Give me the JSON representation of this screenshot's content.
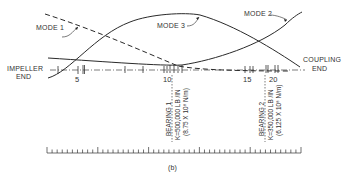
{
  "diagram": {
    "subfigure_label": "(b)",
    "modes": [
      {
        "id": "mode1",
        "label": "MODE 1",
        "style": "dashed"
      },
      {
        "id": "mode2",
        "label": "MODE 2",
        "style": "solid"
      },
      {
        "id": "mode3",
        "label": "MODE 3",
        "style": "solid"
      }
    ],
    "ends": {
      "left": {
        "line1": "IMPELLER",
        "line2": "END"
      },
      "right": {
        "line1": "COUPLING",
        "line2": "END"
      }
    },
    "station_labels": [
      "5",
      "10",
      "15",
      "20"
    ],
    "bearings": [
      {
        "name": "BEARING 1",
        "stiffness_english": "K=500,000 LB /IN",
        "stiffness_si": "(8.75 X 10⁸ N/m)"
      },
      {
        "name": "BEARING 2",
        "stiffness_english": "K=350,000 LB /IN",
        "stiffness_si": "(6.125 X 10⁸ N/m)"
      }
    ],
    "colors": {
      "line": "#2a2a2a",
      "text": "#333333",
      "background": "#ffffff"
    }
  }
}
